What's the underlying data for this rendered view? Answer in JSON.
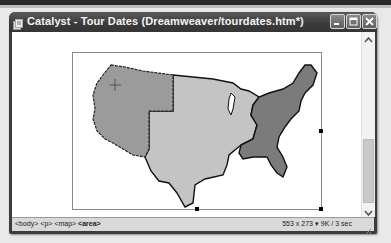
{
  "window": {
    "title": "Catalyst - Tour Dates (Dreamweaver/tourdates.htm*)",
    "controls": {
      "minimize": "minimize",
      "maximize": "maximize",
      "close": "close"
    }
  },
  "document": {
    "image": {
      "description": "US map image with hotspot regions",
      "regions": [
        {
          "name": "west",
          "color": "#9b9b9b"
        },
        {
          "name": "central",
          "color": "#c4c4c4"
        },
        {
          "name": "east",
          "color": "#7b7b7b"
        }
      ]
    }
  },
  "statusbar": {
    "tags": [
      "<body>",
      "<p>",
      "<map>",
      "<area>"
    ],
    "dimensions": "553 x 273",
    "download": "9K / 3 sec"
  },
  "colors": {
    "titlebar": "#3c3c3c",
    "content_bg": "#ffffff",
    "statusbar_bg": "#d9d9d9"
  }
}
